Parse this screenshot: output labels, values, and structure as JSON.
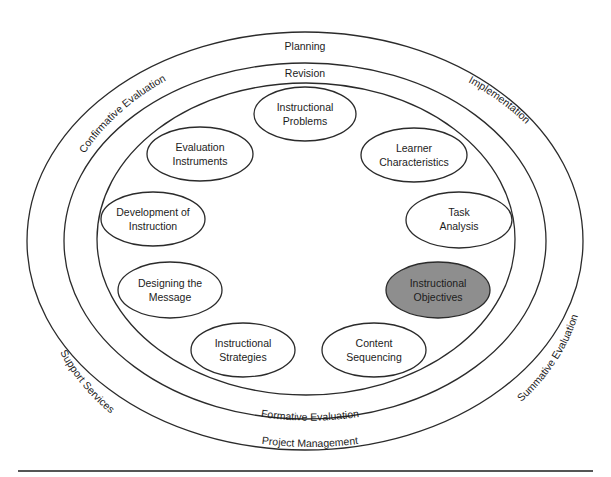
{
  "rings": {
    "outer": {
      "top": "Planning",
      "upper_left": "Confirmative Evaluation",
      "upper_right": "Implementation",
      "lower_left": "Support Services",
      "lower_right": "Summative Evaluation",
      "bottom": "Project Management"
    },
    "middle": {
      "top": "Revision",
      "bottom": "Formative Evaluation"
    }
  },
  "nodes": [
    {
      "id": "instructional-problems",
      "line1": "Instructional",
      "line2": "Problems",
      "highlighted": false
    },
    {
      "id": "learner-characteristics",
      "line1": "Learner",
      "line2": "Characteristics",
      "highlighted": false
    },
    {
      "id": "task-analysis",
      "line1": "Task",
      "line2": "Analysis",
      "highlighted": false
    },
    {
      "id": "instructional-objectives",
      "line1": "Instructional",
      "line2": "Objectives",
      "highlighted": true
    },
    {
      "id": "content-sequencing",
      "line1": "Content",
      "line2": "Sequencing",
      "highlighted": false
    },
    {
      "id": "instructional-strategies",
      "line1": "Instructional",
      "line2": "Strategies",
      "highlighted": false
    },
    {
      "id": "designing-the-message",
      "line1": "Designing the",
      "line2": "Message",
      "highlighted": false
    },
    {
      "id": "development-of-instruction",
      "line1": "Development of",
      "line2": "Instruction",
      "highlighted": false
    },
    {
      "id": "evaluation-instruments",
      "line1": "Evaluation",
      "line2": "Instruments",
      "highlighted": false
    }
  ],
  "colors": {
    "highlight_fill": "#8e8e8e",
    "stroke": "#2b2b2b"
  }
}
